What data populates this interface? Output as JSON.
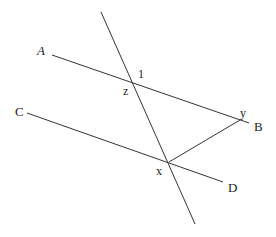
{
  "diagram": {
    "type": "geometry-parallel-lines-transversal",
    "line_color": "#333333",
    "background": "#ffffff",
    "lines": [
      {
        "name": "AB",
        "from": [
          52,
          55
        ],
        "to": [
          249,
          123
        ]
      },
      {
        "name": "CD",
        "from": [
          27,
          113
        ],
        "to": [
          223,
          182
        ]
      },
      {
        "name": "transversal",
        "from": [
          101,
          12
        ],
        "to": [
          195,
          224
        ]
      },
      {
        "name": "xy",
        "from": [
          169,
          162
        ],
        "to": [
          240,
          120
        ]
      }
    ],
    "labels": {
      "A": "A",
      "B": "B",
      "C": "C",
      "D": "D",
      "x": "x",
      "y": "y",
      "z": "z",
      "angle1": "1"
    }
  }
}
